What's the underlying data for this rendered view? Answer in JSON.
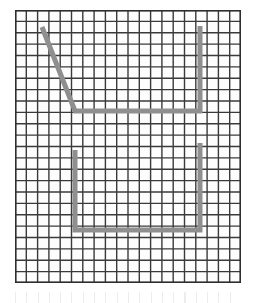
{
  "figure": {
    "title": "",
    "background_color": "#ffffff",
    "grid": {
      "origin_x": 15,
      "origin_y": 10,
      "width": 226,
      "height": 273,
      "columns": 20,
      "rows": 24,
      "cell_width": 11.3,
      "cell_height": 11.375,
      "line_color": "#3a3a3a",
      "line_width": 1.4,
      "cell_fill": "#fdfdfd",
      "border_color": "#2e2e2e",
      "border_width": 1.6
    },
    "ghost_strip": {
      "visible": true,
      "color": "#e9e9e9",
      "origin_y": 292,
      "height": 11
    },
    "path": {
      "stroke_color": "#8f8f8f",
      "stroke_width": 5,
      "line_cap": "butt",
      "line_join": "miter",
      "shapes": [
        {
          "name": "diagonal-hook-shape",
          "points": [
            [
              27,
              17
            ],
            [
              60,
              101
            ],
            [
              185,
              101
            ],
            [
              185,
              16
            ]
          ]
        },
        {
          "name": "u-bracket-shape",
          "points": [
            [
              60,
              140
            ],
            [
              60,
              220
            ],
            [
              185,
              220
            ],
            [
              185,
              133
            ]
          ]
        }
      ]
    }
  }
}
